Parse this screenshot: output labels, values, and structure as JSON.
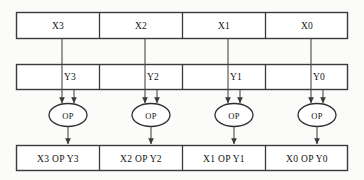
{
  "diagram": {
    "background_color": "#fbfbfa",
    "line_color": "#4a4a4a",
    "box_stroke_color": "#3a3a3a",
    "box_fill_color": "#ffffff",
    "text_color": "#111111",
    "lanes": 4,
    "operand_rows": [
      {
        "name": "x-register-row",
        "cells": [
          {
            "label": "X3"
          },
          {
            "label": "X2"
          },
          {
            "label": "X1"
          },
          {
            "label": "X0"
          }
        ]
      },
      {
        "name": "y-register-row",
        "cells": [
          {
            "label": "Y3"
          },
          {
            "label": "Y2"
          },
          {
            "label": "Y1"
          },
          {
            "label": "Y0"
          }
        ]
      }
    ],
    "operators": [
      {
        "label": "OP"
      },
      {
        "label": "OP"
      },
      {
        "label": "OP"
      },
      {
        "label": "OP"
      }
    ],
    "result_row": {
      "name": "result-register-row",
      "cells": [
        {
          "label": "X3 OP Y3"
        },
        {
          "label": "X2 OP Y2"
        },
        {
          "label": "X1 OP Y1"
        },
        {
          "label": "X0 OP Y0"
        }
      ]
    }
  }
}
